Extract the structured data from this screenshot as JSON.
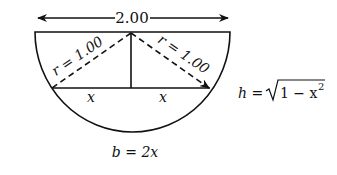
{
  "diagram": {
    "title": "",
    "width_label": "2.00",
    "radius_label_left": "r = 1.00",
    "radius_label_right": "r = 1.00",
    "half_chord_label_left": "x",
    "half_chord_label_right": "x",
    "base_formula": "b = 2x",
    "height_formula": {
      "lhs": "h =",
      "radicand": "1 − x",
      "exponent": "2"
    },
    "colors": {
      "stroke": "#111111",
      "background": "#ffffff"
    }
  }
}
